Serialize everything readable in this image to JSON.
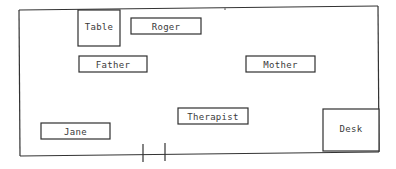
{
  "diagram": {
    "type": "room-seating-layout",
    "room": {
      "outline": {
        "x1": 19,
        "y1": 10,
        "x2": 378,
        "y2": 6,
        "x3": 379,
        "y3": 152,
        "x4": 19,
        "y4": 156
      }
    },
    "door": {
      "marks": [
        {
          "x": 143,
          "y1": 144,
          "y2": 162
        },
        {
          "x": 165,
          "y1": 143,
          "y2": 161
        }
      ]
    },
    "furniture": [
      {
        "id": "table",
        "label": "Table",
        "x": 78,
        "y": 10,
        "w": 42,
        "h": 36
      },
      {
        "id": "desk",
        "label": "Desk",
        "x": 323,
        "y": 109,
        "w": 56,
        "h": 42
      }
    ],
    "people": [
      {
        "id": "roger",
        "label": "Roger",
        "x": 131,
        "y": 18,
        "w": 70,
        "h": 16
      },
      {
        "id": "father",
        "label": "Father",
        "x": 79,
        "y": 56,
        "w": 68,
        "h": 16
      },
      {
        "id": "mother",
        "label": "Mother",
        "x": 246,
        "y": 56,
        "w": 69,
        "h": 16
      },
      {
        "id": "therapist",
        "label": "Therapist",
        "x": 178,
        "y": 108,
        "w": 70,
        "h": 16
      },
      {
        "id": "jane",
        "label": "Jane",
        "x": 41,
        "y": 123,
        "w": 69,
        "h": 16
      }
    ],
    "colors": {
      "line": "#333333",
      "text": "#3a3a3a",
      "background": "#ffffff"
    }
  }
}
